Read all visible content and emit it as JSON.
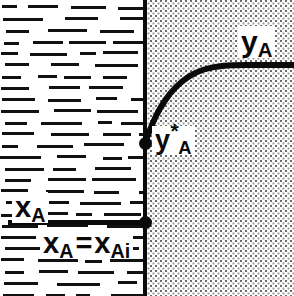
{
  "figure": {
    "regions": {
      "liquid": {
        "name": "liquid-phase",
        "pattern": "horizontal-dashes",
        "color": "#111111"
      },
      "gas": {
        "name": "gas-phase",
        "pattern": "stipple-dots",
        "color": "#6a6a6a"
      }
    },
    "interface": {
      "label": "interface",
      "color": "#0a0a0a"
    }
  },
  "labels": {
    "ya_bulk": {
      "base": "y",
      "subscript": "A",
      "superscript": "",
      "full": "yA"
    },
    "ya_interface": {
      "base": "y",
      "subscript": "A",
      "superscript": "*",
      "full": "yA*"
    },
    "xa_bulk": {
      "base": "x",
      "subscript": "A",
      "full": "xA"
    },
    "xa_interface": {
      "base_left": "x",
      "subscript_left": "A",
      "equals": "=",
      "base_right": "x",
      "subscript_right": "Ai",
      "full": "xA = xAi"
    }
  },
  "chart_data": {
    "type": "line",
    "xlabel": "",
    "ylabel": "",
    "xlim": [
      0,
      294
    ],
    "ylim": [
      296,
      0
    ],
    "grid": false,
    "legend": "none",
    "interface_x": 145,
    "series": [
      {
        "name": "yA",
        "description": "Gas-phase composition profile rising from interface value to bulk value",
        "points": [
          [
            145,
            143
          ],
          [
            152,
            124
          ],
          [
            160,
            108
          ],
          [
            170,
            93
          ],
          [
            182,
            81
          ],
          [
            196,
            72
          ],
          [
            212,
            67
          ],
          [
            232,
            65
          ],
          [
            260,
            65
          ],
          [
            294,
            65
          ]
        ]
      },
      {
        "name": "xA",
        "description": "Liquid-phase composition, uniform (well mixed) up to the interface",
        "points": [
          [
            8,
            222
          ],
          [
            145,
            222
          ]
        ]
      }
    ],
    "annotations": [
      {
        "text": "yA",
        "x": 252,
        "y": 40,
        "name": "ya-bulk-label"
      },
      {
        "text": "yA*",
        "x": 165,
        "y": 140,
        "name": "ya-interface-label"
      },
      {
        "text": "xA",
        "x": 26,
        "y": 206,
        "name": "xa-bulk-label"
      },
      {
        "text": "xA = xAi",
        "x": 88,
        "y": 242,
        "name": "xa-interface-label"
      }
    ],
    "markers": [
      {
        "x": 145,
        "y": 143,
        "name": "interface-gas-point"
      },
      {
        "x": 145,
        "y": 222,
        "name": "interface-liquid-point"
      }
    ]
  }
}
